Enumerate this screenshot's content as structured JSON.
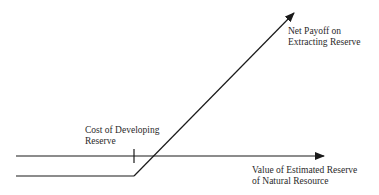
{
  "diagram": {
    "type": "payoff-diagram",
    "labels": {
      "payoff_line": [
        "Net Payoff on",
        "Extracting Reserve"
      ],
      "cost_marker": [
        "Cost of Developing",
        "Reserve"
      ],
      "x_axis": [
        "Value of Estimated Reserve",
        "of Natural Resource"
      ]
    },
    "colors": {
      "line": "#1a1a1a",
      "text": "#2a2a2a",
      "background": "#ffffff"
    }
  }
}
